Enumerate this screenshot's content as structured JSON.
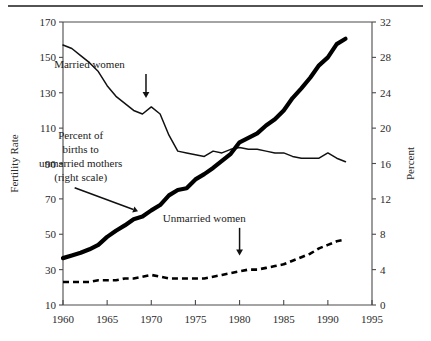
{
  "figure": {
    "top_rule": true,
    "left_axis_title": "Fertility Rate",
    "right_axis_title": "Percent"
  },
  "chart_data": {
    "type": "line",
    "title": "",
    "subtitle": "",
    "xlabel": "",
    "ylabel": "Fertility Rate",
    "y2label": "Percent",
    "xlim": [
      1960,
      1995
    ],
    "ylim": [
      10,
      170
    ],
    "y2lim": [
      0,
      32
    ],
    "xticks": [
      1960,
      1965,
      1970,
      1975,
      1980,
      1985,
      1990,
      1995
    ],
    "xtick_labels": [
      "1960",
      "1965",
      "1970",
      "1975",
      "1980",
      "1985",
      "1990",
      "1995"
    ],
    "yticks": [
      10,
      30,
      50,
      70,
      90,
      110,
      130,
      150,
      170
    ],
    "ytick_labels": [
      "10",
      "30",
      "50",
      "70",
      "90",
      "110",
      "130",
      "150",
      "170"
    ],
    "y2ticks": [
      0,
      4,
      8,
      12,
      16,
      20,
      24,
      28,
      32
    ],
    "y2tick_labels": [
      "0",
      "4",
      "8",
      "12",
      "16",
      "20",
      "24",
      "28",
      "32"
    ],
    "grid": false,
    "legend_position": "none",
    "series": [
      {
        "name": "Married women",
        "axis": "left",
        "style": "solid-thin",
        "x": [
          1960,
          1961,
          1962,
          1963,
          1964,
          1965,
          1966,
          1967,
          1968,
          1969,
          1970,
          1971,
          1972,
          1973,
          1974,
          1975,
          1976,
          1977,
          1978,
          1979,
          1980,
          1981,
          1982,
          1983,
          1984,
          1985,
          1986,
          1987,
          1988,
          1989,
          1990,
          1991,
          1992
        ],
        "values": [
          157,
          155,
          151,
          147,
          142,
          134,
          128,
          124,
          120,
          118,
          122,
          118,
          106,
          97,
          96,
          95,
          94,
          97,
          96,
          98,
          99,
          98,
          98,
          97,
          96,
          96,
          94,
          93,
          93,
          93,
          96,
          93,
          91
        ]
      },
      {
        "name": "Unmarried women",
        "axis": "left",
        "style": "dashed",
        "x": [
          1960,
          1961,
          1962,
          1963,
          1964,
          1965,
          1966,
          1967,
          1968,
          1969,
          1970,
          1971,
          1972,
          1973,
          1974,
          1975,
          1976,
          1977,
          1978,
          1979,
          1980,
          1981,
          1982,
          1983,
          1984,
          1985,
          1986,
          1987,
          1988,
          1989,
          1990,
          1991,
          1992
        ],
        "values": [
          23,
          23,
          23,
          23,
          24,
          24,
          24,
          25,
          25,
          26,
          27,
          26,
          25,
          25,
          25,
          25,
          25,
          26,
          27,
          28,
          29,
          30,
          30,
          31,
          32,
          33,
          35,
          37,
          39,
          42,
          44,
          46,
          47
        ]
      },
      {
        "name": "Percent of births to unmarried mothers",
        "axis": "right",
        "style": "solid-thick",
        "x": [
          1960,
          1961,
          1962,
          1963,
          1964,
          1965,
          1966,
          1967,
          1968,
          1969,
          1970,
          1971,
          1972,
          1973,
          1974,
          1975,
          1976,
          1977,
          1978,
          1979,
          1980,
          1981,
          1982,
          1983,
          1984,
          1985,
          1986,
          1987,
          1988,
          1989,
          1990,
          1991,
          1992
        ],
        "values": [
          5.3,
          5.6,
          5.9,
          6.3,
          6.8,
          7.7,
          8.4,
          9.0,
          9.7,
          10.0,
          10.7,
          11.3,
          12.4,
          13.0,
          13.2,
          14.2,
          14.8,
          15.5,
          16.3,
          17.1,
          18.4,
          18.9,
          19.4,
          20.3,
          21.0,
          22.0,
          23.4,
          24.5,
          25.7,
          27.1,
          28.0,
          29.5,
          30.1
        ]
      }
    ],
    "annotations": [
      {
        "name": "married-women",
        "lines": [
          "Married women"
        ],
        "text_x": 1963.0,
        "text_y": 144.0,
        "arrow": "down",
        "arrow_target_x": 1969.4,
        "arrow_target_y": 127.0
      },
      {
        "name": "percent-births-unmarried",
        "lines": [
          "Percent of",
          "births to",
          "unmarried mothers",
          "(right scale)"
        ],
        "text_x": 1962.0,
        "text_y": 104.0,
        "arrow": "diagonal",
        "arrow_target_x": 1968.5,
        "arrow_target_y": 63.0
      },
      {
        "name": "unmarried-women",
        "lines": [
          "Unmarried women"
        ],
        "text_x": 1976.0,
        "text_y": 57.0,
        "arrow": "down",
        "arrow_target_x": 1980.0,
        "arrow_target_y": 38.0
      }
    ]
  }
}
